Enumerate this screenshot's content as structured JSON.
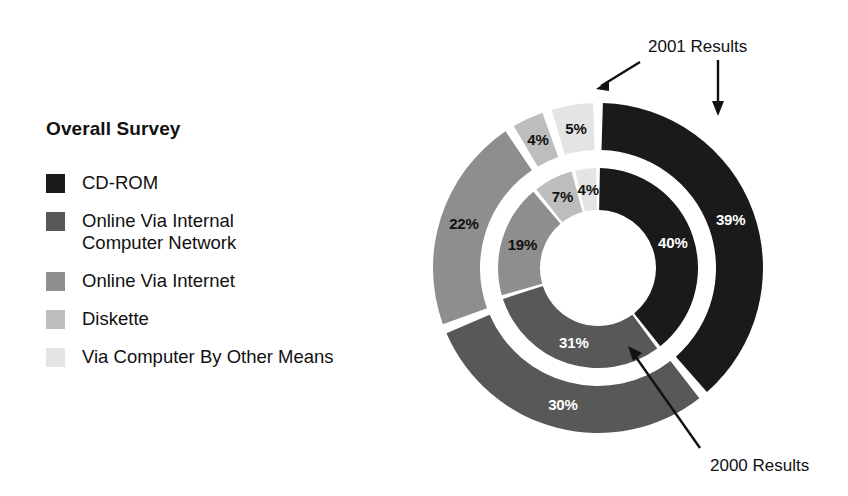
{
  "legend": {
    "title": "Overall Survey",
    "items": [
      {
        "label": "CD-ROM",
        "color": "#1a1a1a",
        "key": "cd-rom"
      },
      {
        "label": "Online Via Internal\nComputer Network",
        "color": "#585858",
        "key": "online-internal"
      },
      {
        "label": "Online Via Internet",
        "color": "#8e8e8e",
        "key": "online-internet"
      },
      {
        "label": "Diskette",
        "color": "#bdbdbd",
        "key": "diskette"
      },
      {
        "label": "Via Computer By Other Means",
        "color": "#e4e4e4",
        "key": "other-means"
      }
    ]
  },
  "callouts": {
    "outer": "2001 Results",
    "inner": "2000 Results"
  },
  "chart_data": {
    "type": "pie",
    "title": "Overall Survey",
    "subtype": "nested-donut",
    "categories": [
      "CD-ROM",
      "Online Via Internal Computer Network",
      "Online Via Internet",
      "Diskette",
      "Via Computer By Other Means"
    ],
    "colors": [
      "#1a1a1a",
      "#585858",
      "#8e8e8e",
      "#bdbdbd",
      "#e4e4e4"
    ],
    "series": [
      {
        "name": "2001 Results",
        "ring": "outer",
        "values": [
          39,
          30,
          22,
          4,
          5
        ],
        "labels": [
          "39%",
          "30%",
          "22%",
          "4%",
          "5%"
        ]
      },
      {
        "name": "2000 Results",
        "ring": "inner",
        "values": [
          40,
          31,
          19,
          7,
          4
        ],
        "labels": [
          "40%",
          "31%",
          "19%",
          "7%",
          "4%"
        ]
      }
    ],
    "start_angle_deg": 0,
    "direction": "clockwise",
    "legend_position": "left",
    "grid": false,
    "xlabel": "",
    "ylabel": ""
  },
  "geometry": {
    "cx": 598,
    "cy": 268,
    "inner_ring": {
      "r_inner": 58,
      "r_outer": 100,
      "gap_deg": 2.2
    },
    "outer_ring": {
      "r_inner": 118,
      "r_outer": 165,
      "gap_deg": 3.4
    },
    "label_radius_inner": 79,
    "label_radius_outer": 141
  }
}
